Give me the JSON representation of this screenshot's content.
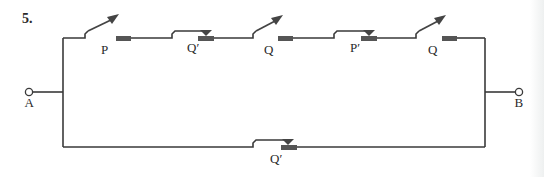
{
  "problem_number": "5.",
  "terminals": {
    "left": "A",
    "right": "B"
  },
  "top_branch": {
    "switches": [
      {
        "label": "P",
        "type": "normally-open"
      },
      {
        "label": "Q′",
        "type": "normally-closed"
      },
      {
        "label": "Q",
        "type": "normally-open"
      },
      {
        "label": "P′",
        "type": "normally-closed"
      },
      {
        "label": "Q",
        "type": "normally-open"
      }
    ]
  },
  "bottom_branch": {
    "switches": [
      {
        "label": "Q′",
        "type": "normally-closed"
      }
    ]
  }
}
